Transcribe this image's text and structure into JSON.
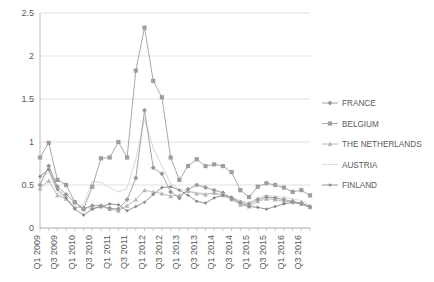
{
  "chart_data": {
    "type": "line",
    "title": "",
    "xlabel": "",
    "ylabel": "",
    "ylim": [
      0,
      2.5
    ],
    "yticks": [
      "0",
      "0.5",
      "1",
      "1.5",
      "2",
      "2.5"
    ],
    "ytick_values": [
      0,
      0.5,
      1,
      1.5,
      2,
      2.5
    ],
    "grid": true,
    "legend_position": "right",
    "categories": [
      "Q1 2009",
      "Q2 2009",
      "Q3 2009",
      "Q4 2009",
      "Q1 2010",
      "Q2 2010",
      "Q3 2010",
      "Q4 2010",
      "Q1 2011",
      "Q2 2011",
      "Q3 2011",
      "Q4 2011",
      "Q1 2012",
      "Q2 2012",
      "Q3 2012",
      "Q4 2012",
      "Q1 2013",
      "Q2 2013",
      "Q3 2013",
      "Q4 2013",
      "Q1 2014",
      "Q2 2014",
      "Q3 2014",
      "Q4 2014",
      "Q1 2015",
      "Q2 2015",
      "Q3 2015",
      "Q4 2015",
      "Q1 2016",
      "Q2 2016",
      "Q3 2016",
      "Q4 2016"
    ],
    "xtick_labels": [
      "Q1 2009",
      "Q3 2009",
      "Q1 2010",
      "Q3 2010",
      "Q1 2011",
      "Q3 2011",
      "Q1 2012",
      "Q3 2012",
      "Q1 2013",
      "Q3 2013",
      "Q1 2014",
      "Q3 2014",
      "Q1 2015",
      "Q3 2015",
      "Q1 2016",
      "Q3 2016"
    ],
    "series": [
      {
        "name": "FRANCE",
        "color": "#9a9a9a",
        "marker": "diamond",
        "values": [
          0.5,
          0.72,
          0.48,
          0.39,
          0.3,
          0.22,
          0.26,
          0.26,
          0.23,
          0.22,
          0.33,
          0.58,
          1.37,
          0.7,
          0.63,
          0.42,
          0.35,
          0.45,
          0.5,
          0.47,
          0.44,
          0.41,
          0.34,
          0.3,
          0.28,
          0.33,
          0.36,
          0.35,
          0.33,
          0.31,
          0.29,
          0.25
        ]
      },
      {
        "name": "BELGIUM",
        "color": "#9e9e9e",
        "marker": "square",
        "values": [
          0.82,
          0.99,
          0.56,
          0.5,
          0.3,
          0.22,
          0.48,
          0.81,
          0.82,
          1.0,
          0.82,
          1.83,
          2.33,
          1.71,
          1.52,
          0.82,
          0.56,
          0.72,
          0.8,
          0.72,
          0.74,
          0.72,
          0.65,
          0.44,
          0.36,
          0.48,
          0.52,
          0.5,
          0.47,
          0.42,
          0.44,
          0.38
        ]
      },
      {
        "name": "THE NETHERLANDS",
        "color": "#b5b5b5",
        "marker": "triangle",
        "values": [
          0.46,
          0.55,
          0.38,
          0.34,
          0.24,
          0.24,
          0.23,
          0.25,
          0.22,
          0.2,
          0.26,
          0.33,
          0.44,
          0.42,
          0.4,
          0.37,
          0.38,
          0.43,
          0.4,
          0.39,
          0.41,
          0.38,
          0.33,
          0.27,
          0.25,
          0.31,
          0.34,
          0.33,
          0.31,
          0.3,
          0.28,
          0.24
        ]
      },
      {
        "name": "AUSTRIA",
        "color": "#dcdcdc",
        "marker": "none",
        "values": [
          0.57,
          0.65,
          0.42,
          0.33,
          0.23,
          0.28,
          0.54,
          0.53,
          0.47,
          0.42,
          0.46,
          0.8,
          1.27,
          0.93,
          0.72,
          0.52,
          0.45,
          0.43,
          0.41,
          0.4,
          0.4,
          0.38,
          0.36,
          0.32,
          0.3,
          0.35,
          0.38,
          0.37,
          0.36,
          0.34,
          0.32,
          0.26
        ]
      },
      {
        "name": "FINLAND",
        "color": "#8a8a8a",
        "marker": "smalldiamond",
        "values": [
          0.6,
          0.68,
          0.45,
          0.35,
          0.22,
          0.15,
          0.22,
          0.25,
          0.28,
          0.27,
          0.2,
          0.25,
          0.3,
          0.39,
          0.47,
          0.48,
          0.44,
          0.38,
          0.31,
          0.29,
          0.35,
          0.38,
          0.36,
          0.29,
          0.25,
          0.24,
          0.22,
          0.25,
          0.28,
          0.3,
          0.28,
          0.24
        ]
      }
    ]
  },
  "legend": {
    "items": [
      {
        "label": "FRANCE"
      },
      {
        "label": "BELGIUM"
      },
      {
        "label": "THE NETHERLANDS"
      },
      {
        "label": "AUSTRIA"
      },
      {
        "label": "FINLAND"
      }
    ]
  }
}
